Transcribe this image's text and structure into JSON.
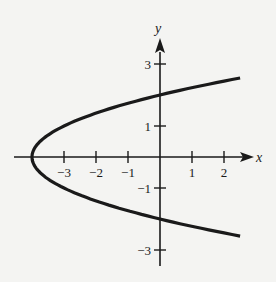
{
  "chart_data": {
    "type": "line",
    "title": "",
    "xlabel": "x",
    "ylabel": "y",
    "equation": "x = y^2 - 4",
    "xlim": [
      -4.2,
      2.8
    ],
    "ylim": [
      -3.5,
      3.8
    ],
    "grid": false,
    "x_ticks": [
      -3,
      -2,
      -1,
      1,
      2
    ],
    "x_tick_labels": [
      "−3",
      "−2",
      "−1",
      "1",
      "2"
    ],
    "y_ticks": [
      3,
      1,
      -1,
      -3
    ],
    "y_tick_labels": [
      "3",
      "1",
      "−1",
      "−3"
    ],
    "series": [
      {
        "name": "parabola",
        "points": [
          {
            "x": 2.5,
            "y": -2.55
          },
          {
            "x": 1.0,
            "y": -2.24
          },
          {
            "x": 0.0,
            "y": -2.0
          },
          {
            "x": -1.0,
            "y": -1.73
          },
          {
            "x": -2.0,
            "y": -1.41
          },
          {
            "x": -3.0,
            "y": -1.0
          },
          {
            "x": -3.75,
            "y": -0.5
          },
          {
            "x": -4.0,
            "y": 0.0
          },
          {
            "x": -3.75,
            "y": 0.5
          },
          {
            "x": -3.0,
            "y": 1.0
          },
          {
            "x": -2.0,
            "y": 1.41
          },
          {
            "x": -1.0,
            "y": 1.73
          },
          {
            "x": 0.0,
            "y": 2.0
          },
          {
            "x": 1.0,
            "y": 2.24
          },
          {
            "x": 2.5,
            "y": 2.55
          }
        ]
      }
    ],
    "annotations": {
      "vertex": {
        "x": -4,
        "y": 0
      },
      "y_intercepts": [
        2,
        -2
      ]
    }
  },
  "colors": {
    "background": "#f4f4f2",
    "ink": "#1a1a1a"
  }
}
